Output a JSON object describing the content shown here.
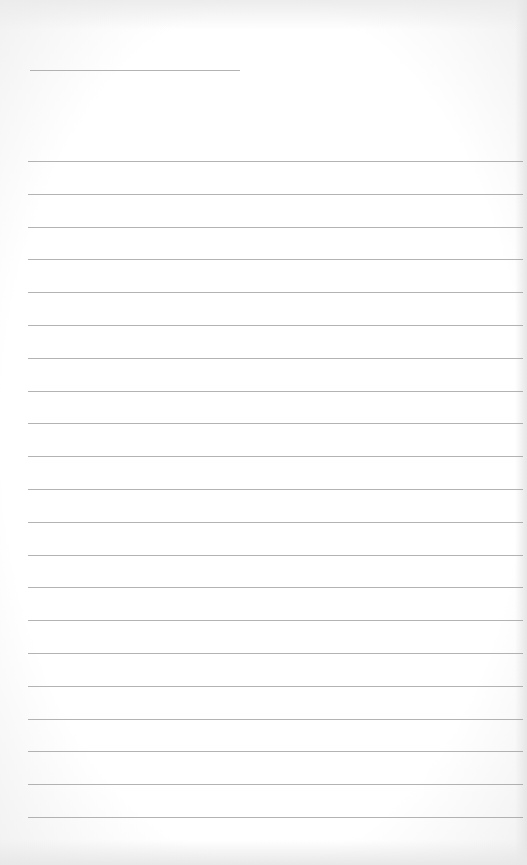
{
  "page": {
    "type": "blank lined paper",
    "name_line": {
      "x": 30,
      "y": 70,
      "width": 210
    },
    "ruled_lines": {
      "count": 21,
      "start_y": 161,
      "spacing": 32.8,
      "x": 28,
      "width": 495
    },
    "line_color": "#9a9a9a",
    "background_color": "#ffffff"
  }
}
